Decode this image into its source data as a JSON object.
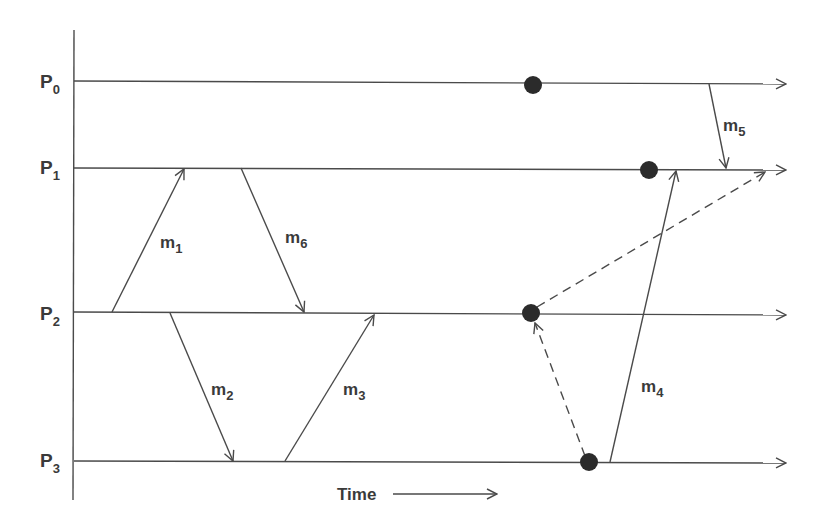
{
  "diagram": {
    "type": "space-time diagram",
    "time_label": "Time",
    "processes": [
      {
        "id": "P0",
        "letter": "P",
        "sub": "0",
        "y": 82
      },
      {
        "id": "P1",
        "letter": "P",
        "sub": "1",
        "y": 169
      },
      {
        "id": "P2",
        "letter": "P",
        "sub": "2",
        "y": 313
      },
      {
        "id": "P3",
        "letter": "P",
        "sub": "3",
        "y": 461
      }
    ],
    "messages": [
      {
        "id": "m1",
        "letter": "m",
        "sub": "1",
        "from": "P2",
        "to": "P1",
        "style": "solid"
      },
      {
        "id": "m2",
        "letter": "m",
        "sub": "2",
        "from": "P2",
        "to": "P3",
        "style": "solid"
      },
      {
        "id": "m3",
        "letter": "m",
        "sub": "3",
        "from": "P3",
        "to": "P2",
        "style": "solid"
      },
      {
        "id": "m4",
        "letter": "m",
        "sub": "4",
        "from": "P3",
        "to": "P1",
        "style": "solid"
      },
      {
        "id": "m5",
        "letter": "m",
        "sub": "5",
        "from": "P0",
        "to": "P1",
        "style": "solid"
      },
      {
        "id": "m6",
        "letter": "m",
        "sub": "6",
        "from": "P1",
        "to": "P2",
        "style": "solid"
      }
    ],
    "dashed_arrows": [
      {
        "from": "P3",
        "to": "P2",
        "description": "dashed arrow from P3 event to P2 event"
      },
      {
        "from": "P2",
        "to": "P1",
        "description": "dashed arrow from P2 event to P1"
      }
    ],
    "events": [
      {
        "process": "P0",
        "x": 533
      },
      {
        "process": "P1",
        "x": 649
      },
      {
        "process": "P2",
        "x": 531
      },
      {
        "process": "P3",
        "x": 589
      }
    ],
    "colors": {
      "ink": "#4a4a4a",
      "event": "#2b2b2b",
      "background": "#ffffff"
    }
  }
}
